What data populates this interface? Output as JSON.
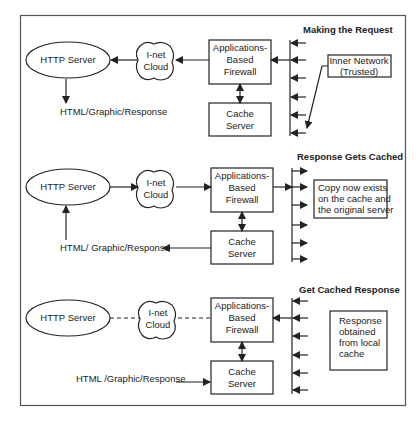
{
  "frame": {
    "border_color": "#555555"
  },
  "panels": [
    {
      "title": "Making the Request",
      "http_server": "HTTP Server",
      "cloud": [
        "I-net",
        "Cloud"
      ],
      "firewall": [
        "Applications-",
        "Based",
        "Firewall"
      ],
      "cache": [
        "Cache",
        "Server"
      ],
      "response_label": "HTML/Graphic/Response",
      "note": [
        "Inner Network",
        "(Trusted)"
      ],
      "flow": "request: inner network -> firewall -> cloud -> http server -> response"
    },
    {
      "title": "Response Gets Cached",
      "http_server": "HTTP Server",
      "cloud": [
        "I-net",
        "Cloud"
      ],
      "firewall": [
        "Applications-",
        "Based",
        "Firewall"
      ],
      "cache": [
        "Cache",
        "Server"
      ],
      "response_label": "HTML/ Graphic/Response",
      "note": [
        "Copy now exists",
        "on the cache and",
        "the original server"
      ],
      "flow": "response: http server -> cloud -> firewall -> inner network; cache -> response"
    },
    {
      "title": "Get  Cached Response",
      "http_server": "HTTP Server",
      "cloud": [
        "I-net",
        "Cloud"
      ],
      "firewall": [
        "Applications-",
        "Based",
        "Firewall"
      ],
      "cache": [
        "Cache",
        "Server"
      ],
      "response_label": "HTML /Graphic/Response",
      "note": [
        "Response",
        "obtained",
        "from local",
        "cache"
      ],
      "flow": "request served from cache; internet path dashed (unused)"
    }
  ]
}
